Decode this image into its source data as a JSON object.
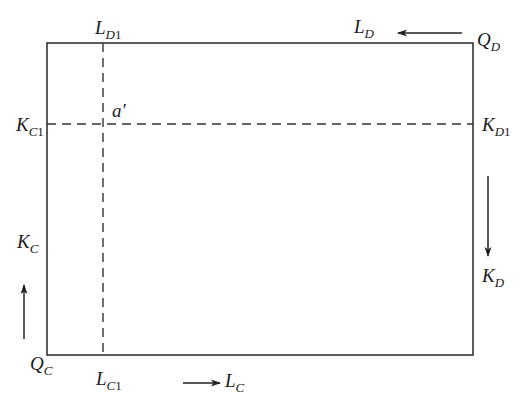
{
  "diagram": {
    "type": "edgeworth-box",
    "colors": {
      "line": "#333333",
      "text": "#1a1a1a",
      "background": "#ffffff"
    },
    "box": {
      "x": 47,
      "y": 43,
      "width": 426,
      "height": 312
    },
    "dashed_lines": {
      "vertical_x": 103,
      "horizontal_y": 124
    },
    "labels": {
      "origin_C": {
        "main": "Q",
        "sub": "C"
      },
      "origin_D": {
        "main": "Q",
        "sub": "D"
      },
      "L_C": {
        "main": "L",
        "sub": "C"
      },
      "L_D": {
        "main": "L",
        "sub": "D"
      },
      "K_C": {
        "main": "K",
        "sub": "C"
      },
      "K_D": {
        "main": "K",
        "sub": "D"
      },
      "L_C1": {
        "main": "L",
        "sub": "C",
        "sub_num": "1"
      },
      "L_D1": {
        "main": "L",
        "sub": "D",
        "sub_num": "1"
      },
      "K_C1": {
        "main": "K",
        "sub": "C",
        "sub_num": "1"
      },
      "K_D1": {
        "main": "K",
        "sub": "D",
        "sub_num": "1"
      },
      "point_a": {
        "text": "a′"
      }
    },
    "arrows": [
      {
        "name": "L_D-direction",
        "direction": "left"
      },
      {
        "name": "K_D-direction",
        "direction": "down"
      },
      {
        "name": "L_C-direction",
        "direction": "right"
      },
      {
        "name": "K_C-direction",
        "direction": "up"
      }
    ]
  }
}
